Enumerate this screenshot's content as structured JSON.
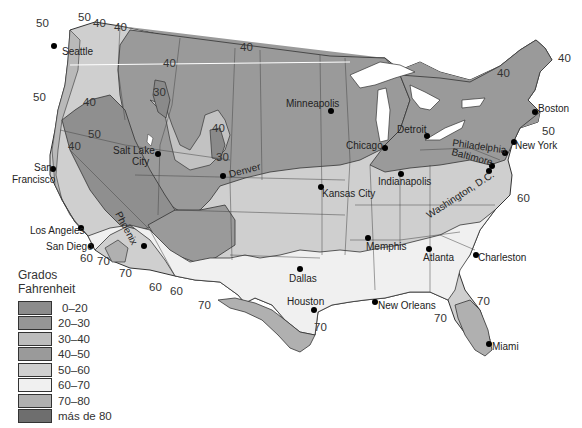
{
  "legend": {
    "title_line1": "Grados",
    "title_line2": "Fahrenheit",
    "items": [
      {
        "label": "0–20",
        "color": "#8c8c8c"
      },
      {
        "label": "20–30",
        "color": "#969696"
      },
      {
        "label": "30–40",
        "color": "#bdbdbd"
      },
      {
        "label": "40–50",
        "color": "#9a9a9a"
      },
      {
        "label": "50–60",
        "color": "#cfcfcf"
      },
      {
        "label": "60–70",
        "color": "#f0f0f0"
      },
      {
        "label": "70–80",
        "color": "#b0b0b0"
      },
      {
        "label": "más de 80",
        "color": "#6e6e6e"
      }
    ]
  },
  "cities": [
    {
      "name": "Seattle"
    },
    {
      "name": "San Francisco",
      "line1": "San",
      "line2": "Francisco"
    },
    {
      "name": "Los Angeles"
    },
    {
      "name": "San Diego"
    },
    {
      "name": "Salt Lake City",
      "line1": "Salt Lake",
      "line2": "City"
    },
    {
      "name": "Phoenix"
    },
    {
      "name": "Denver"
    },
    {
      "name": "Minneapolis"
    },
    {
      "name": "Chicago"
    },
    {
      "name": "Detroit"
    },
    {
      "name": "Kansas City"
    },
    {
      "name": "Indianapolis"
    },
    {
      "name": "Dallas"
    },
    {
      "name": "Houston"
    },
    {
      "name": "Memphis"
    },
    {
      "name": "Atlanta"
    },
    {
      "name": "New Orleans"
    },
    {
      "name": "Miami"
    },
    {
      "name": "Charleston"
    },
    {
      "name": "Washington, D.C."
    },
    {
      "name": "Baltimore"
    },
    {
      "name": "Philadelphia"
    },
    {
      "name": "New York"
    },
    {
      "name": "Boston"
    }
  ],
  "isotherm_labels": [
    {
      "value": "50",
      "x": 36,
      "y": 18
    },
    {
      "value": "50",
      "x": 78,
      "y": 12
    },
    {
      "value": "40",
      "x": 93,
      "y": 18
    },
    {
      "value": "40",
      "x": 114,
      "y": 22
    },
    {
      "value": "50",
      "x": 33,
      "y": 92
    },
    {
      "value": "40",
      "x": 83,
      "y": 97
    },
    {
      "value": "40",
      "x": 163,
      "y": 58
    },
    {
      "value": "30",
      "x": 153,
      "y": 87
    },
    {
      "value": "40",
      "x": 240,
      "y": 42
    },
    {
      "value": "50",
      "x": 88,
      "y": 129
    },
    {
      "value": "40",
      "x": 68,
      "y": 141
    },
    {
      "value": "40",
      "x": 212,
      "y": 123
    },
    {
      "value": "30",
      "x": 216,
      "y": 152
    },
    {
      "value": "60",
      "x": 80,
      "y": 253
    },
    {
      "value": "70",
      "x": 97,
      "y": 256
    },
    {
      "value": "70",
      "x": 119,
      "y": 268
    },
    {
      "value": "60",
      "x": 149,
      "y": 282
    },
    {
      "value": "60",
      "x": 170,
      "y": 286
    },
    {
      "value": "70",
      "x": 198,
      "y": 300
    },
    {
      "value": "70",
      "x": 314,
      "y": 322
    },
    {
      "value": "40",
      "x": 497,
      "y": 68
    },
    {
      "value": "40",
      "x": 558,
      "y": 53
    },
    {
      "value": "50",
      "x": 542,
      "y": 126
    },
    {
      "value": "60",
      "x": 517,
      "y": 193
    },
    {
      "value": "70",
      "x": 477,
      "y": 296
    },
    {
      "value": "70",
      "x": 434,
      "y": 313
    }
  ]
}
